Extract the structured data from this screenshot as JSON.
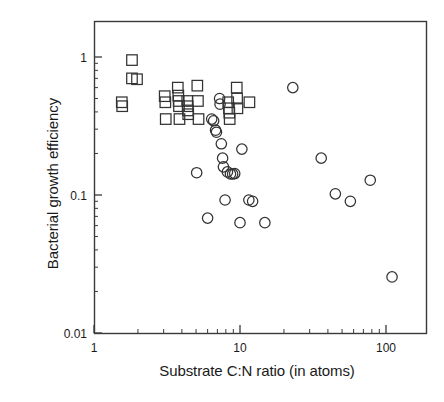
{
  "figure": {
    "background": "#ffffff",
    "axis_color": "#3a3a3a",
    "marker_color": "#333333"
  },
  "chart_data": {
    "type": "scatter",
    "title": "",
    "xlabel": "Substrate C:N ratio (in atoms)",
    "ylabel": "Bacterial growth efficiency",
    "xscale": "log",
    "yscale": "log",
    "xlim": [
      1,
      200
    ],
    "ylim": [
      0.01,
      2
    ],
    "grid": false,
    "legend": "none",
    "xticks": [
      1,
      10,
      100
    ],
    "xtick_labels": [
      "1",
      "10",
      "100"
    ],
    "yticks": [
      0.01,
      0.1,
      1
    ],
    "ytick_labels": [
      "0.01",
      "0.1",
      "1"
    ],
    "series": [
      {
        "name": "squares",
        "marker": "square",
        "filled": false,
        "points": [
          [
            1.55,
            0.47
          ],
          [
            1.56,
            0.44
          ],
          [
            1.82,
            0.95
          ],
          [
            1.82,
            0.7
          ],
          [
            1.97,
            0.69
          ],
          [
            3.05,
            0.52
          ],
          [
            3.08,
            0.47
          ],
          [
            3.1,
            0.355
          ],
          [
            3.75,
            0.6
          ],
          [
            3.78,
            0.525
          ],
          [
            3.8,
            0.48
          ],
          [
            3.82,
            0.44
          ],
          [
            3.85,
            0.355
          ],
          [
            4.35,
            0.48
          ],
          [
            4.38,
            0.44
          ],
          [
            4.4,
            0.41
          ],
          [
            4.42,
            0.385
          ],
          [
            5.1,
            0.62
          ],
          [
            5.15,
            0.48
          ],
          [
            5.2,
            0.355
          ],
          [
            8.3,
            0.47
          ],
          [
            8.4,
            0.425
          ],
          [
            8.45,
            0.395
          ],
          [
            8.5,
            0.355
          ],
          [
            9.5,
            0.6
          ],
          [
            9.55,
            0.5
          ],
          [
            9.6,
            0.425
          ],
          [
            11.6,
            0.47
          ]
        ]
      },
      {
        "name": "circles",
        "marker": "circle",
        "filled": false,
        "points": [
          [
            5.05,
            0.145
          ],
          [
            6.0,
            0.068
          ],
          [
            6.4,
            0.355
          ],
          [
            6.6,
            0.345
          ],
          [
            6.8,
            0.295
          ],
          [
            6.9,
            0.285
          ],
          [
            7.25,
            0.5
          ],
          [
            7.3,
            0.455
          ],
          [
            7.45,
            0.235
          ],
          [
            7.6,
            0.185
          ],
          [
            7.7,
            0.16
          ],
          [
            7.9,
            0.092
          ],
          [
            8.2,
            0.147
          ],
          [
            8.6,
            0.142
          ],
          [
            8.9,
            0.142
          ],
          [
            9.2,
            0.143
          ],
          [
            10.0,
            0.063
          ],
          [
            10.3,
            0.215
          ],
          [
            11.5,
            0.092
          ],
          [
            12.2,
            0.09
          ],
          [
            14.8,
            0.063
          ],
          [
            23.0,
            0.6
          ],
          [
            36.0,
            0.185
          ],
          [
            45.0,
            0.102
          ],
          [
            57.0,
            0.09
          ],
          [
            78.0,
            0.128
          ],
          [
            110.0,
            0.0255
          ]
        ]
      }
    ]
  }
}
